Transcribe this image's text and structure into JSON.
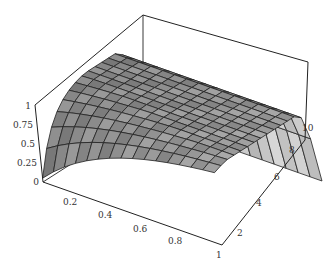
{
  "chart_data": {
    "type": "surface3d",
    "title": "",
    "x_axis": {
      "label": "",
      "ticks": [
        "0.2",
        "0.4",
        "0.6",
        "0.8",
        "1"
      ],
      "range": [
        0,
        1
      ]
    },
    "y_axis": {
      "label": "",
      "ticks": [
        "2",
        "4",
        "6",
        "8",
        "10"
      ],
      "range": [
        1,
        11
      ]
    },
    "z_axis": {
      "label": "",
      "ticks": [
        "0",
        "0.25",
        "0.5",
        "0.75",
        "1"
      ],
      "range": [
        0,
        1
      ]
    },
    "grid": false,
    "legend": null,
    "mesh": {
      "nx": 15,
      "ny": 15
    },
    "colors": {
      "surface": "#8a8a8a",
      "surface_light": "#c8c8c8",
      "mesh": "#222222",
      "box": "#222222"
    }
  },
  "ticks": {
    "z": [
      "1",
      "0.75",
      "0.5",
      "0.25",
      "0"
    ],
    "x": [
      "0.2",
      "0.4",
      "0.6",
      "0.8",
      "1"
    ],
    "y": [
      "2",
      "4",
      "6",
      "8",
      "10"
    ]
  }
}
